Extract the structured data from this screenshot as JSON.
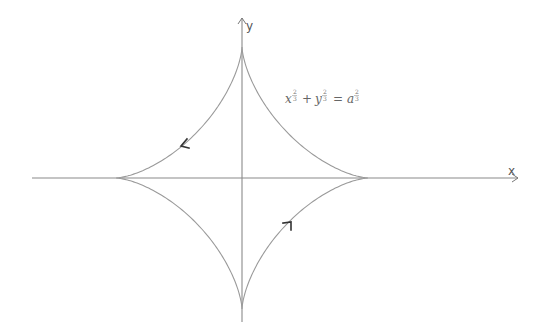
{
  "diagram": {
    "axes": {
      "x_label": "x",
      "y_label": "y"
    },
    "equation": {
      "term1_base": "x",
      "term2_base": "y",
      "rhs_base": "a",
      "exponent_num": "2",
      "exponent_den": "3",
      "plus": "+",
      "equals": "=",
      "text": "x^(2/3) + y^(2/3) = a^(2/3)"
    },
    "curve": {
      "type": "astroid",
      "center_px": [
        242,
        178
      ],
      "half_width_px": 126,
      "half_height_px": 131,
      "cusps": [
        "top",
        "right",
        "bottom",
        "left"
      ],
      "direction_arrows": [
        {
          "position": "upper-left arc",
          "points": "down-left"
        },
        {
          "position": "lower-right arc",
          "points": "up-right"
        }
      ]
    },
    "colors": {
      "axis": "#8a8a8a",
      "curve": "#9a9a9a",
      "arrowheads": "#333333",
      "background": "#ffffff"
    }
  }
}
